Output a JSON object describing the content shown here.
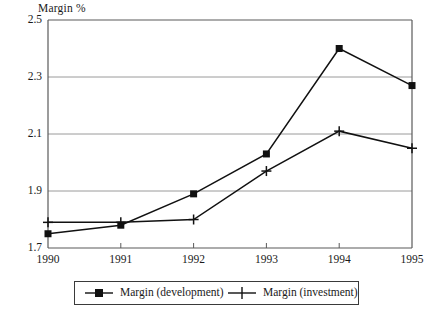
{
  "chart_data": {
    "type": "line",
    "title": "",
    "xlabel": "",
    "ylabel": "Margin %",
    "categories": [
      "1990",
      "1991",
      "1992",
      "1993",
      "1994",
      "1995"
    ],
    "x": [
      1990,
      1991,
      1992,
      1993,
      1994,
      1995
    ],
    "series": [
      {
        "name": "Margin (development)",
        "marker": "square",
        "color": "#111111",
        "values": [
          1.75,
          1.78,
          1.89,
          2.03,
          2.4,
          2.27
        ]
      },
      {
        "name": "Margin (investment)",
        "marker": "plus",
        "color": "#111111",
        "values": [
          1.79,
          1.79,
          1.8,
          1.97,
          2.11,
          2.05
        ]
      }
    ],
    "ylim": [
      1.7,
      2.5
    ],
    "yticks": [
      "1.7",
      "1.9",
      "2.1",
      "2.3",
      "2.5"
    ],
    "ytick_values": [
      1.7,
      1.9,
      2.1,
      2.3,
      2.5
    ],
    "xlim": [
      1990,
      1995
    ],
    "grid": true,
    "grid_axis": "y",
    "legend_position": "bottom"
  },
  "axes": {
    "y_title": "Margin %"
  },
  "legend": {
    "entries": [
      {
        "label": "Margin (development)",
        "marker": "square"
      },
      {
        "label": "Margin (investment)",
        "marker": "plus"
      }
    ]
  },
  "colors": {
    "line": "#111111",
    "grid": "#9a9a9a",
    "frame": "#5a5a5a",
    "background": "#ffffff"
  }
}
